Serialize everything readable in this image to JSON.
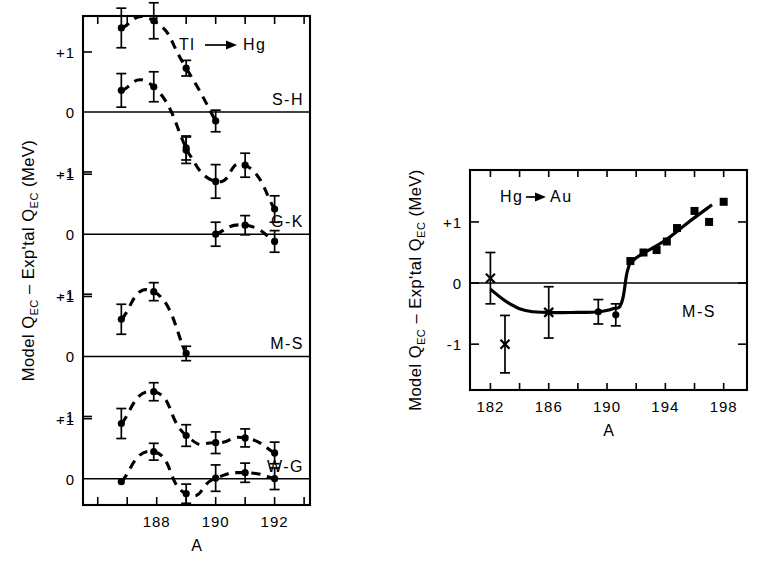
{
  "figure": {
    "background": "#ffffff",
    "ink": "#000000"
  },
  "left_panel": {
    "axis": {
      "xlabel": "A",
      "ylabel_parts": {
        "main": "Model Q",
        "sub1": "EC",
        "mid": " – Exp'tal Q",
        "sub2": "EC",
        "units": " (MeV)"
      },
      "ylabel_plain": "Model Q_EC – Exp'tal Q_EC  (MeV)",
      "xticks": [
        186,
        187,
        188,
        189,
        190,
        191,
        192,
        193
      ],
      "xtick_labels": [
        "",
        "",
        "188",
        "",
        "190",
        "",
        "192",
        ""
      ],
      "xlim": [
        185.5,
        193.2
      ],
      "ytick_labels": [
        "+1",
        "0",
        "-1",
        "+1",
        "0",
        "-1",
        "+1",
        "0",
        "-1",
        "+1",
        "0",
        "-1"
      ],
      "reaction": "Tl → Hg",
      "reaction_from": "Tl",
      "reaction_to": "Hg",
      "arrow": "→"
    },
    "panels": [
      {
        "name": "S-H",
        "label": "S-H",
        "ylim": [
          -0.55,
          2.05
        ],
        "zero": 0,
        "ticks": [
          1
        ],
        "series": [
          {
            "name": "upper-branch",
            "style": "dashed",
            "points": [
              {
                "x": 186.8,
                "y": 1.4,
                "err": 0.33
              },
              {
                "x": 187.9,
                "y": 1.52,
                "err": 0.3
              },
              {
                "x": 189.0,
                "y": 0.73,
                "err": 0.13
              },
              {
                "x": 190.0,
                "y": -0.15,
                "err": 0.18
              }
            ]
          },
          {
            "name": "lower-branch",
            "style": "dashed",
            "points": [
              {
                "x": 186.8,
                "y": 0.36,
                "err": 0.28
              },
              {
                "x": 187.9,
                "y": 0.42,
                "err": 0.25
              },
              {
                "x": 189.0,
                "y": -0.6,
                "err": 0.2
              }
            ]
          }
        ]
      },
      {
        "name": "G-K",
        "label": "G-K",
        "ylim": [
          -0.55,
          2.05
        ],
        "zero": 0,
        "ticks": [
          1
        ],
        "series": [
          {
            "name": "main-branch",
            "style": "dashed",
            "points": [
              {
                "x": 189.0,
                "y": 1.4,
                "err": 0.22
              },
              {
                "x": 190.0,
                "y": 0.88,
                "err": 0.28
              },
              {
                "x": 191.0,
                "y": 1.15,
                "err": 0.2
              },
              {
                "x": 192.0,
                "y": 0.42,
                "err": 0.22
              }
            ]
          },
          {
            "name": "low-branch",
            "style": "dashed",
            "points": [
              {
                "x": 190.0,
                "y": 0.0,
                "err": 0.2
              },
              {
                "x": 191.0,
                "y": 0.15,
                "err": 0.16
              },
              {
                "x": 192.0,
                "y": -0.12,
                "err": 0.18
              }
            ]
          }
        ]
      },
      {
        "name": "M-S",
        "label": "M-S",
        "ylim": [
          -0.55,
          2.05
        ],
        "zero": 0,
        "ticks": [
          1
        ],
        "series": [
          {
            "name": "main-branch",
            "style": "dashed",
            "points": [
              {
                "x": 186.8,
                "y": 0.62,
                "err": 0.25
              },
              {
                "x": 187.9,
                "y": 1.08,
                "err": 0.15
              },
              {
                "x": 189.0,
                "y": 0.05,
                "err": 0.12
              }
            ]
          }
        ]
      },
      {
        "name": "W-G",
        "label": "W-G",
        "ylim": [
          -0.55,
          2.05
        ],
        "zero": 0,
        "ticks": [
          1
        ],
        "series": [
          {
            "name": "upper-branch",
            "style": "dashed",
            "points": [
              {
                "x": 186.8,
                "y": 0.92,
                "err": 0.25
              },
              {
                "x": 187.9,
                "y": 1.45,
                "err": 0.15
              },
              {
                "x": 189.0,
                "y": 0.72,
                "err": 0.18
              },
              {
                "x": 190.0,
                "y": 0.6,
                "err": 0.18
              },
              {
                "x": 191.0,
                "y": 0.68,
                "err": 0.15
              },
              {
                "x": 192.0,
                "y": 0.43,
                "err": 0.18
              }
            ]
          },
          {
            "name": "lower-branch",
            "style": "dashed",
            "points": [
              {
                "x": 186.8,
                "y": -0.05,
                "err": 0.0
              },
              {
                "x": 187.9,
                "y": 0.45,
                "err": 0.14
              },
              {
                "x": 189.0,
                "y": -0.25,
                "err": 0.16
              },
              {
                "x": 190.0,
                "y": 0.01,
                "err": 0.22
              },
              {
                "x": 191.0,
                "y": 0.1,
                "err": 0.16
              },
              {
                "x": 192.0,
                "y": 0.0,
                "err": 0.18
              }
            ]
          }
        ]
      }
    ]
  },
  "right_panel": {
    "axis": {
      "xlabel": "A",
      "ylabel_plain": "Model Q_EC – Exp'tal Q_EC  (MeV)",
      "ylabel_parts": {
        "main": "Model Q",
        "sub1": "EC",
        "mid": " – Exp'tal Q",
        "sub2": "EC",
        "units": " (MeV)"
      },
      "xticks": [
        181,
        182,
        183,
        184,
        185,
        186,
        187,
        188,
        189,
        190,
        191,
        192,
        193,
        194,
        195,
        196,
        197,
        198,
        199
      ],
      "xtick_labels": [
        "182",
        "186",
        "190",
        "194",
        "198"
      ],
      "xtick_label_values": [
        182,
        186,
        190,
        194,
        198
      ],
      "xlim": [
        180.6,
        199.6
      ],
      "yticks": [
        1,
        0,
        -1
      ],
      "ytick_labels": [
        "+1",
        "0",
        "-1"
      ],
      "ylim": [
        -1.75,
        1.85
      ],
      "reaction": "Hg → Au",
      "reaction_from": "Hg",
      "reaction_to": "Au",
      "arrow": "→"
    },
    "panel_label": "M-S",
    "series": [
      {
        "name": "cross-points",
        "marker": "x",
        "points": [
          {
            "x": 182.0,
            "y": 0.08,
            "err": 0.42
          },
          {
            "x": 183.0,
            "y": -1.0,
            "err": 0.47
          },
          {
            "x": 186.0,
            "y": -0.48,
            "err": 0.42
          }
        ]
      },
      {
        "name": "circle-points",
        "marker": "circle",
        "points": [
          {
            "x": 189.4,
            "y": -0.47,
            "err": 0.2
          },
          {
            "x": 190.6,
            "y": -0.52,
            "err": 0.18
          }
        ]
      },
      {
        "name": "square-points",
        "marker": "square",
        "points": [
          {
            "x": 191.6,
            "y": 0.36,
            "err": 0
          },
          {
            "x": 192.5,
            "y": 0.5,
            "err": 0
          },
          {
            "x": 193.4,
            "y": 0.54,
            "err": 0
          },
          {
            "x": 194.1,
            "y": 0.68,
            "err": 0
          },
          {
            "x": 194.8,
            "y": 0.9,
            "err": 0
          },
          {
            "x": 196.0,
            "y": 1.18,
            "err": 0
          },
          {
            "x": 197.0,
            "y": 1.0,
            "err": 0
          },
          {
            "x": 198.0,
            "y": 1.33,
            "err": 0
          }
        ]
      },
      {
        "name": "fit-curve",
        "style": "solid",
        "points": [
          {
            "x": 182.0,
            "y": -0.1
          },
          {
            "x": 183.2,
            "y": -0.32
          },
          {
            "x": 184.4,
            "y": -0.45
          },
          {
            "x": 186.0,
            "y": -0.48
          },
          {
            "x": 188.0,
            "y": -0.48
          },
          {
            "x": 189.4,
            "y": -0.47
          },
          {
            "x": 190.4,
            "y": -0.42
          },
          {
            "x": 191.0,
            "y": -0.32
          },
          {
            "x": 191.4,
            "y": 0.2
          },
          {
            "x": 191.8,
            "y": 0.37
          },
          {
            "x": 192.6,
            "y": 0.5
          },
          {
            "x": 194.0,
            "y": 0.7
          },
          {
            "x": 195.5,
            "y": 0.98
          },
          {
            "x": 197.2,
            "y": 1.28
          }
        ]
      }
    ]
  },
  "chart_data": {
    "type": "scatter",
    "title": "",
    "subplots": [
      {
        "id": "left",
        "title": "Tl → Hg",
        "xlabel": "A",
        "ylabel": "Model Q_EC – Exp'tal Q_EC  (MeV)",
        "xlim": [
          185.5,
          193.2
        ],
        "grid": false,
        "stacked_panels": [
          "S-H",
          "G-K",
          "M-S",
          "W-G"
        ],
        "panel_ylim": [
          -1,
          1
        ],
        "series": [
          {
            "name": "S-H upper",
            "x": [
              186.8,
              187.9,
              189.0,
              190.0
            ],
            "y": [
              0.4,
              0.52,
              -0.27,
              -1.15
            ],
            "yerr": [
              0.33,
              0.3,
              0.13,
              0.18
            ]
          },
          {
            "name": "S-H lower",
            "x": [
              186.8,
              187.9,
              189.0
            ],
            "y": [
              -0.64,
              -0.58,
              -1.6
            ],
            "yerr": [
              0.28,
              0.25,
              0.2
            ]
          },
          {
            "name": "G-K upper",
            "x": [
              189.0,
              190.0,
              191.0,
              192.0
            ],
            "y": [
              0.4,
              -0.12,
              0.15,
              -0.58
            ],
            "yerr": [
              0.22,
              0.28,
              0.2,
              0.22
            ]
          },
          {
            "name": "G-K lower",
            "x": [
              190.0,
              191.0,
              192.0
            ],
            "y": [
              -1.0,
              -0.85,
              -1.12
            ],
            "yerr": [
              0.2,
              0.16,
              0.18
            ]
          },
          {
            "name": "M-S",
            "x": [
              186.8,
              187.9,
              189.0
            ],
            "y": [
              -0.38,
              0.08,
              -0.95
            ],
            "yerr": [
              0.25,
              0.15,
              0.12
            ]
          },
          {
            "name": "W-G upper",
            "x": [
              186.8,
              187.9,
              189.0,
              190.0,
              191.0,
              192.0
            ],
            "y": [
              -0.08,
              0.45,
              -0.28,
              -0.4,
              -0.32,
              -0.57
            ],
            "yerr": [
              0.25,
              0.15,
              0.18,
              0.18,
              0.15,
              0.18
            ]
          },
          {
            "name": "W-G lower",
            "x": [
              187.9,
              189.0,
              190.0,
              191.0,
              192.0
            ],
            "y": [
              -0.55,
              -1.25,
              -0.99,
              -0.9,
              -1.0
            ],
            "yerr": [
              0.14,
              0.16,
              0.22,
              0.16,
              0.18
            ]
          }
        ]
      },
      {
        "id": "right",
        "title": "Hg → Au",
        "panel_label": "M-S",
        "xlabel": "A",
        "ylabel": "Model Q_EC – Exp'tal Q_EC  (MeV)",
        "xlim": [
          180.6,
          199.6
        ],
        "ylim": [
          -1.75,
          1.85
        ],
        "grid": false,
        "series": [
          {
            "name": "crosses",
            "marker": "x",
            "x": [
              182,
              183,
              186
            ],
            "y": [
              0.08,
              -1.0,
              -0.48
            ],
            "yerr": [
              0.42,
              0.47,
              0.42
            ]
          },
          {
            "name": "circles",
            "marker": "o",
            "x": [
              189.4,
              190.6
            ],
            "y": [
              -0.47,
              -0.52
            ],
            "yerr": [
              0.2,
              0.18
            ]
          },
          {
            "name": "squares",
            "marker": "s",
            "x": [
              191.6,
              192.5,
              193.4,
              194.1,
              194.8,
              196.0,
              197.0,
              198.0
            ],
            "y": [
              0.36,
              0.5,
              0.54,
              0.68,
              0.9,
              1.18,
              1.0,
              1.33
            ]
          }
        ]
      }
    ]
  }
}
